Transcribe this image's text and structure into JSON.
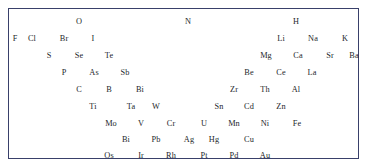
{
  "figure": {
    "kind": "element-symbol-arrangement",
    "border_color": "#39406a",
    "text_color": "#1d1f2b",
    "background_color": "#ffffff"
  },
  "chart_data": {
    "type": "scatter",
    "title": "",
    "xlabel": "",
    "ylabel": "",
    "grid": false,
    "legend": null,
    "note": "Chemical element symbols arranged in a staggered triangular/chevron pattern; left branch descends to the right, right branch descends to the left.",
    "xlim": [
      0,
      351
    ],
    "ylim": [
      0,
      151
    ],
    "rows": [
      {
        "row_index": 1,
        "y": 13,
        "labels": [
          "O",
          "N",
          "H"
        ],
        "x": [
          70,
          179,
          287
        ]
      },
      {
        "row_index": 2,
        "y": 30,
        "labels": [
          "F",
          "Cl",
          "Br",
          "I",
          "Li",
          "Na",
          "K"
        ],
        "x": [
          6,
          23,
          55,
          84,
          272,
          304,
          336
        ]
      },
      {
        "row_index": 3,
        "y": 47,
        "labels": [
          "S",
          "Se",
          "Te",
          "Mg",
          "Ca",
          "Sr",
          "Ba"
        ],
        "x": [
          40,
          70,
          100,
          257,
          289,
          321,
          345
        ]
      },
      {
        "row_index": 4,
        "y": 64,
        "labels": [
          "P",
          "As",
          "Sb",
          "Be",
          "Ce",
          "La"
        ],
        "x": [
          55,
          85,
          116,
          240,
          272,
          303
        ]
      },
      {
        "row_index": 5,
        "y": 81,
        "labels": [
          "C",
          "B",
          "Bi",
          "Zr",
          "Th",
          "Al"
        ],
        "x": [
          70,
          100,
          131,
          225,
          256,
          287
        ]
      },
      {
        "row_index": 6,
        "y": 98,
        "labels": [
          "Ti",
          "Ta",
          "W",
          "Sn",
          "Cd",
          "Zn"
        ],
        "x": [
          84,
          122,
          147,
          210,
          240,
          272
        ]
      },
      {
        "row_index": 7,
        "y": 115,
        "labels": [
          "Mo",
          "V",
          "Cr",
          "U",
          "Mn",
          "Ni",
          "Fe"
        ],
        "x": [
          102,
          132,
          162,
          195,
          225,
          256,
          288
        ]
      },
      {
        "row_index": 8,
        "y": 131,
        "labels": [
          "Bi",
          "Pb",
          "Ag",
          "Hg",
          "Cu"
        ],
        "x": [
          117,
          147,
          180,
          205,
          240
        ]
      },
      {
        "row_index": 9,
        "y": 147,
        "labels": [
          "Os",
          "Ir",
          "Rh",
          "Pt",
          "Pd",
          "Au"
        ],
        "x": [
          100,
          132,
          162,
          195,
          225,
          256
        ]
      }
    ]
  }
}
